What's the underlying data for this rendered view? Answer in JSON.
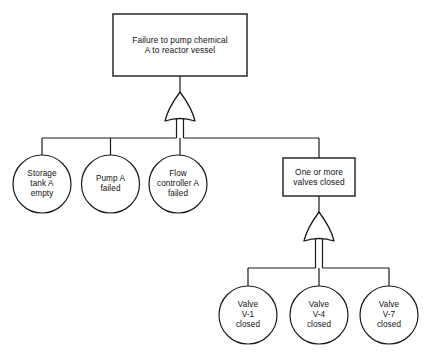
{
  "diagram": {
    "type": "fault-tree",
    "stroke_color": "#1a1a1a",
    "fill_color": "#ffffff",
    "background_color": "#ffffff"
  },
  "top_event": {
    "shape": "rectangle",
    "label": "Failure to pump chemical\nA to reactor vessel",
    "x": 113,
    "y": 14,
    "width": 134,
    "height": 62
  },
  "gates": [
    {
      "id": "gate-1",
      "type": "or-gate",
      "label": "OR",
      "x": 165,
      "y": 92,
      "width": 30,
      "height": 30
    },
    {
      "id": "gate-2",
      "type": "or-gate",
      "label": "OR",
      "x": 304,
      "y": 212,
      "width": 30,
      "height": 30
    }
  ],
  "level_1_events": [
    {
      "id": "basic-storage-tank",
      "shape": "circle",
      "label": "Storage\ntank A\nempty",
      "cx": 42,
      "cy": 184,
      "r": 29
    },
    {
      "id": "basic-pump",
      "shape": "circle",
      "label": "Pump A\nfailed",
      "cx": 110.5,
      "cy": 184,
      "r": 29
    },
    {
      "id": "basic-flow-controller",
      "shape": "circle",
      "label": "Flow\ncontroller A\nfailed",
      "cx": 178,
      "cy": 184,
      "r": 29
    },
    {
      "id": "intermediate-valves",
      "shape": "rectangle",
      "label": "One or more\nvalves closed",
      "x": 283,
      "y": 158,
      "width": 72,
      "height": 38
    }
  ],
  "level_2_events": [
    {
      "id": "basic-valve-v1",
      "shape": "circle",
      "label": "Valve\nV-1\nclosed",
      "cx": 248,
      "cy": 315,
      "r": 29
    },
    {
      "id": "basic-valve-v4",
      "shape": "circle",
      "label": "Valve\nV-4\nclosed",
      "cx": 319,
      "cy": 315,
      "r": 29
    },
    {
      "id": "basic-valve-v7",
      "shape": "circle",
      "label": "Valve\nV-7\nclosed",
      "cx": 389,
      "cy": 315,
      "r": 29
    }
  ],
  "connectors": {
    "top_bus_y": 138,
    "bottom_bus_y": 268
  }
}
